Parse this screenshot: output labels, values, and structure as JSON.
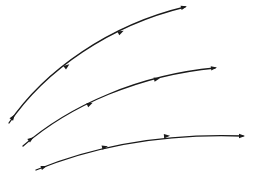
{
  "diagram": {
    "type": "streamlines",
    "background": "#ffffff",
    "stroke_color": "#1a1a1a",
    "curves": [
      {
        "name": "top-curve",
        "path": "M 9 123 C 45 70, 110 25, 185 7",
        "arrows": [
          {
            "x": 13,
            "y": 117,
            "angle": -55
          },
          {
            "x": 67,
            "y": 66,
            "angle": -38
          },
          {
            "x": 121,
            "y": 32,
            "angle": -27
          },
          {
            "x": 184,
            "y": 7,
            "angle": -15
          }
        ]
      },
      {
        "name": "middle-curve",
        "path": "M 23 146 C 70 105, 140 75, 215 68",
        "arrows": [
          {
            "x": 31,
            "y": 139,
            "angle": -38
          },
          {
            "x": 90,
            "y": 104,
            "angle": -25
          },
          {
            "x": 157,
            "y": 79,
            "angle": -14
          },
          {
            "x": 214,
            "y": 68,
            "angle": -8
          }
        ]
      },
      {
        "name": "bottom-curve",
        "path": "M 36 170 C 90 148, 160 133, 243 136",
        "arrows": [
          {
            "x": 44,
            "y": 167,
            "angle": -20
          },
          {
            "x": 105,
            "y": 147,
            "angle": -13
          },
          {
            "x": 167,
            "y": 136,
            "angle": -5
          },
          {
            "x": 242,
            "y": 136,
            "angle": 0
          }
        ]
      }
    ]
  }
}
